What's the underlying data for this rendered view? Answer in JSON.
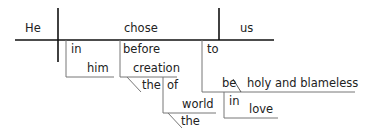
{
  "diagram": {
    "type": "sentence-diagram",
    "colors": {
      "main_line": "#111111",
      "modifier_line": "#777777",
      "text": "#222222",
      "background": "#ffffff"
    },
    "words": {
      "subject": "He",
      "verb": "chose",
      "object": "us",
      "prep1": "in",
      "prep1_object": "him",
      "prep2": "before",
      "prep2_object": "creation",
      "prep2_article": "the",
      "prep3": "of",
      "prep3_object": "world",
      "prep3_article": "the",
      "infinitive": "to",
      "infinitive_verb": "be",
      "predicate": "holy and blameless",
      "prep4": "in",
      "prep4_object": "love"
    }
  }
}
